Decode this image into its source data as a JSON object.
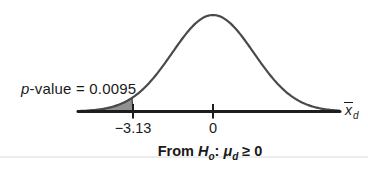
{
  "figure": {
    "annotation_p": {
      "italic_part": "p",
      "rest": "-value = 0.0095"
    },
    "axis_end_label": {
      "base": "x",
      "sub": "d"
    },
    "caption": {
      "word_from": "From ",
      "h": "H",
      "h_sub": "o",
      "colon": ": ",
      "mu": "μ",
      "mu_sub": "d",
      "tail": " ≥ 0"
    },
    "colors": {
      "curve": "#4a4a4a",
      "axis": "#1d1d1d",
      "shade_fill": "#919191",
      "text": "#1a1a1a",
      "rule_line": "#ededed"
    }
  },
  "chart_data": {
    "type": "area",
    "distribution": "normal",
    "title": "",
    "mean": 0,
    "draw_sigma": 1.6,
    "x_range": [
      -5.28,
      4.97
    ],
    "x_ticks": [
      {
        "value": -3.13,
        "label": "−3.13"
      },
      {
        "value": 0,
        "label": "0"
      }
    ],
    "shaded_region": {
      "tail": "left",
      "to": -3.13,
      "area": 0.0095
    },
    "p_value": 0.0095,
    "test_statistic": -3.13,
    "annotation": "p-value = 0.0095",
    "xlabel": "x̄d",
    "caption": "From Ho: μd ≥ 0",
    "grid": false,
    "legend": false
  }
}
